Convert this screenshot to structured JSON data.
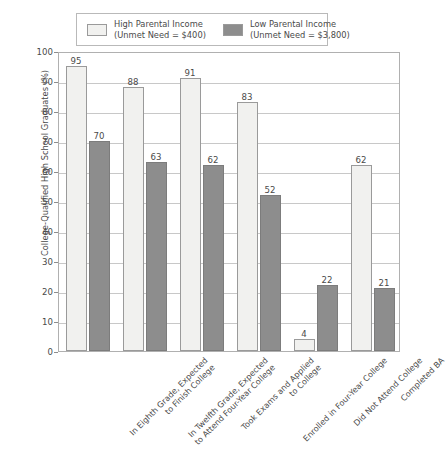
{
  "legend": {
    "entries": [
      {
        "name": "High Parental Income",
        "line1": "High Parental Income",
        "line2": "(Unmet Need = $400)",
        "color": "#f1f1ef"
      },
      {
        "name": "Low Parental Income",
        "line1": "Low Parental Income",
        "line2": "(Unmet Need = $3,800)",
        "color": "#8d8d8d"
      }
    ]
  },
  "chart_data": {
    "type": "bar",
    "title": "",
    "xlabel": "",
    "ylabel": "College-Qualified High School Graduates (%)",
    "ylim": [
      0,
      100
    ],
    "yticks": [
      0,
      10,
      20,
      30,
      40,
      50,
      60,
      70,
      80,
      90,
      100
    ],
    "grid": true,
    "legend_position": "top",
    "categories": [
      "In Eighth Grade, Expected to Finish College",
      "In Twelfth Grade, Expected to Attend Four-Year College",
      "Took Exams and Applied to College",
      "Enrolled in Four-Year College",
      "Did Not Attend College",
      "Completed BA"
    ],
    "category_lines": [
      [
        "In Eighth Grade, Expected",
        "to Finish College"
      ],
      [
        "In Twelfth Grade, Expected",
        "to Attend Four-Year College"
      ],
      [
        "Took Exams and Applied",
        "to College"
      ],
      [
        "Enrolled in Four-Year College",
        ""
      ],
      [
        "Did Not Attend College",
        ""
      ],
      [
        "Completed BA",
        ""
      ]
    ],
    "series": [
      {
        "name": "High Parental Income",
        "values": [
          95,
          88,
          91,
          83,
          4,
          62
        ],
        "color": "#f1f1ef"
      },
      {
        "name": "Low Parental Income",
        "values": [
          70,
          63,
          62,
          52,
          22,
          21
        ],
        "color": "#8d8d8d"
      }
    ]
  }
}
